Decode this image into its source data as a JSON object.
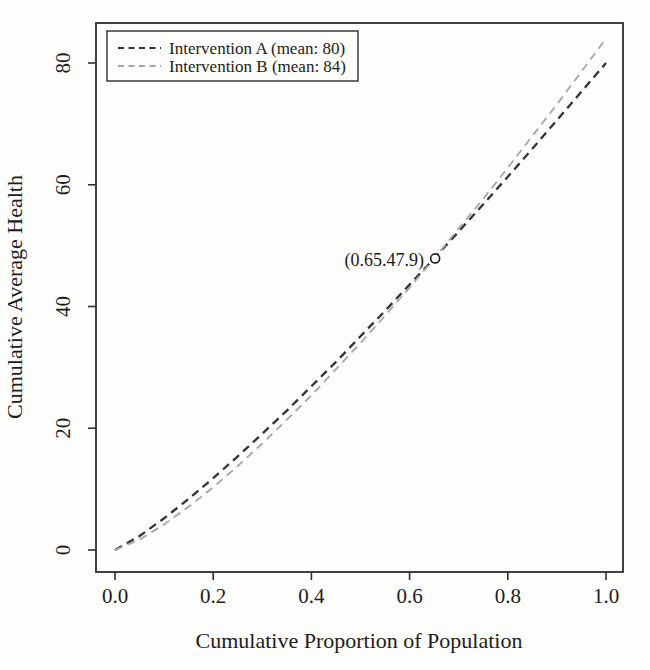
{
  "figure": {
    "background_color": "#fdfdfb",
    "ink_color": "#1c1c1c",
    "box_color": "#2e2e2e"
  },
  "chart_data": {
    "type": "line",
    "title": "",
    "xlabel": "Cumulative Proportion of Population",
    "ylabel": "Cumulative Average Health",
    "xlim": [
      0,
      1
    ],
    "ylim": [
      0,
      86
    ],
    "grid": false,
    "legend_position": "top-left",
    "x_ticks": [
      "0.0",
      "0.2",
      "0.4",
      "0.6",
      "0.8",
      "1.0"
    ],
    "y_ticks": [
      "0",
      "20",
      "40",
      "60",
      "80"
    ],
    "x": [
      0,
      0.05,
      0.1,
      0.15,
      0.2,
      0.25,
      0.3,
      0.35,
      0.4,
      0.45,
      0.5,
      0.55,
      0.6,
      0.65,
      0.7,
      0.75,
      0.8,
      0.85,
      0.9,
      0.95,
      1.0
    ],
    "series": [
      {
        "name": "Intervention A (mean: 80)",
        "mean": 80,
        "color": "#333333",
        "line_style": "dashed",
        "line_width": 2.3,
        "values": [
          0,
          2.3,
          5.2,
          8.4,
          11.8,
          15.4,
          19.1,
          22.9,
          26.9,
          30.9,
          35.1,
          39.3,
          43.6,
          47.9,
          52.3,
          56.8,
          61.3,
          65.9,
          70.6,
          75.3,
          80
        ]
      },
      {
        "name": "Intervention B (mean: 84)",
        "mean": 84,
        "color": "#a6a6a6",
        "line_style": "dashed",
        "line_width": 1.8,
        "values": [
          0,
          1.7,
          4.2,
          7.1,
          10.3,
          13.8,
          17.5,
          21.4,
          25.4,
          29.7,
          34.0,
          38.5,
          43.1,
          47.9,
          52.8,
          57.7,
          62.8,
          68.0,
          73.2,
          78.6,
          84
        ]
      }
    ],
    "annotation": {
      "label": "(0.65.47.9)",
      "x": 0.65,
      "y": 47.9,
      "marker": "open-circle"
    }
  }
}
